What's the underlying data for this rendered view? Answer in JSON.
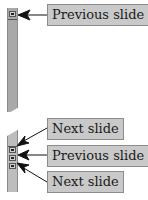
{
  "callouts": [
    {
      "label": "Previous slide",
      "target": "top-scroll-button"
    },
    {
      "label": "Next slide",
      "target": "bottom-button-1"
    },
    {
      "label": "Previous slide",
      "target": "bottom-button-2"
    },
    {
      "label": "Next slide",
      "target": "bottom-button-3"
    }
  ],
  "colors": {
    "track": "#a9a9a9",
    "label_bg": "#c9c9c9",
    "label_border": "#8c8c8c",
    "arrow": "#111111"
  }
}
